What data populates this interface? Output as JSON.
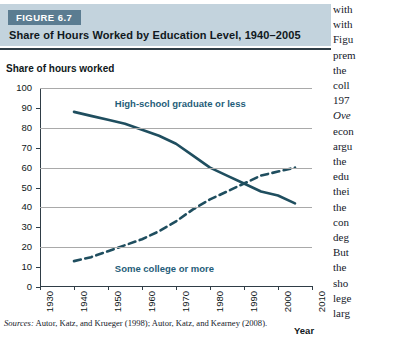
{
  "figure": {
    "badge": "FIGURE 6.7",
    "title": "Share of Hours Worked by Education Level, 1940–2005",
    "sources_prefix": "Sources:",
    "sources_text": " Autor, Katz, and Krueger (1998); Autor, Katz, and Kearney (2008)."
  },
  "colors": {
    "banner_bg": "#c3d3dd",
    "badge_bg": "#5b7c91",
    "line": "#1f4e5f",
    "label": "#1f5d79",
    "grid": "#a9a9a9",
    "axis": "#2f3d46"
  },
  "chart_data": {
    "type": "line",
    "title": "Share of Hours Worked by Education Level, 1940–2005",
    "xlabel": "Year",
    "ylabel": "Share of hours worked",
    "xlim": [
      1930,
      2010
    ],
    "ylim": [
      0,
      100
    ],
    "xticks": [
      "1930",
      "1940",
      "1950",
      "1960",
      "1970",
      "1980",
      "1990",
      "2000",
      "2010"
    ],
    "yticks": [
      "0",
      "10",
      "20",
      "30",
      "40",
      "50",
      "60",
      "70",
      "80",
      "90",
      "100"
    ],
    "gridlines_at": [
      20,
      40,
      60,
      80,
      100
    ],
    "grid": true,
    "legend": "inline-annotations",
    "series": [
      {
        "name": "High-school graduate or less",
        "style": "solid",
        "x": [
          1940,
          1945,
          1950,
          1955,
          1960,
          1965,
          1970,
          1975,
          1980,
          1985,
          1990,
          1995,
          2000,
          2005
        ],
        "values": [
          88,
          86,
          84,
          82,
          79,
          76,
          72,
          66,
          60,
          56,
          52,
          48,
          46,
          42
        ]
      },
      {
        "name": "Some college or more",
        "style": "dashed",
        "x": [
          1940,
          1945,
          1950,
          1955,
          1960,
          1965,
          1970,
          1975,
          1980,
          1985,
          1990,
          1995,
          2000,
          2005
        ],
        "values": [
          13,
          15,
          18,
          21,
          24,
          28,
          33,
          39,
          44,
          48,
          52,
          56,
          58,
          60
        ]
      }
    ],
    "annotations": [
      {
        "text": "High-school graduate or less",
        "x": 1952,
        "y": 92
      },
      {
        "text": "Some college or more",
        "x": 1952,
        "y": 9
      }
    ]
  },
  "body_column": {
    "lines": [
      {
        "text": "with",
        "italic": false
      },
      {
        "text": "with",
        "italic": false
      },
      {
        "text": "Figu",
        "italic": false
      },
      {
        "text": "prem",
        "italic": false
      },
      {
        "text": "the",
        "italic": false
      },
      {
        "text": "coll",
        "italic": false
      },
      {
        "text": "197",
        "italic": false
      },
      {
        "text": "Ove",
        "italic": true
      },
      {
        "text": "econ",
        "italic": false
      },
      {
        "text": "argu",
        "italic": false
      },
      {
        "text": "the",
        "italic": false
      },
      {
        "text": "edu",
        "italic": false
      },
      {
        "text": "thei",
        "italic": false
      },
      {
        "text": "the",
        "italic": false
      },
      {
        "text": "con",
        "italic": false
      },
      {
        "text": "deg",
        "italic": false
      },
      {
        "text": "But",
        "italic": false
      },
      {
        "text": "the",
        "italic": false
      },
      {
        "text": "sho",
        "italic": false
      },
      {
        "text": "lege",
        "italic": false
      },
      {
        "text": "larg",
        "italic": false
      }
    ]
  }
}
